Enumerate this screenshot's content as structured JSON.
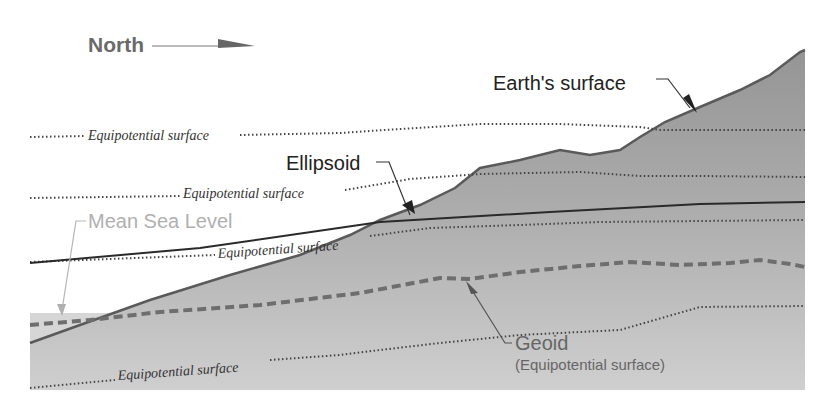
{
  "diagram": {
    "direction_label": "North",
    "labels": {
      "earth_surface": "Earth's surface",
      "ellipsoid": "Ellipsoid",
      "mean_sea_level": "Mean Sea Level",
      "geoid": "Geoid",
      "geoid_sub": "(Equipotential surface)",
      "equipotential_1": "Equipotential surface",
      "equipotential_2": "Equipotential surface",
      "equipotential_3": "Equipotential surface",
      "equipotential_4": "Equipotential surface"
    },
    "colors": {
      "terrain_upper": "#9a9a9a",
      "terrain_lower": "#c6c6c6",
      "sea": "#d4d4d4",
      "outline": "#5a5a5a",
      "ellipsoid_line": "#2a2a2a",
      "geoid_dash": "#6e6e6e",
      "msl_text": "#b0b0b0",
      "text": "#222222"
    }
  }
}
